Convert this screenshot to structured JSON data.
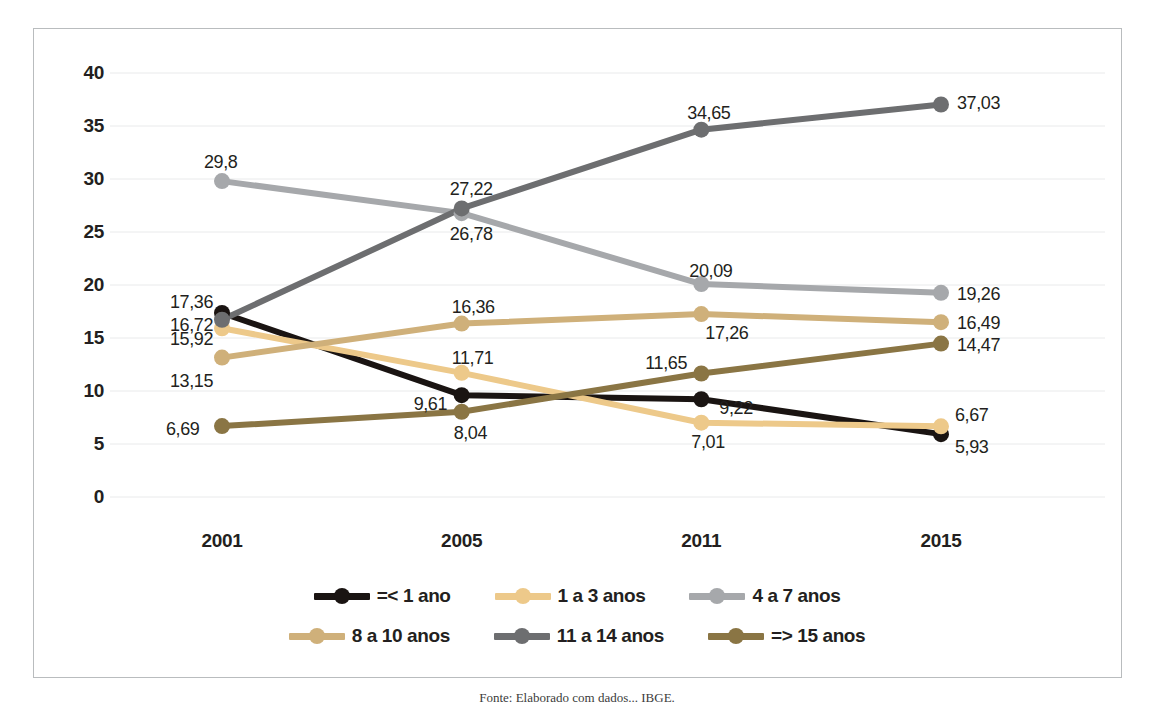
{
  "chart_data": {
    "type": "line",
    "title": "",
    "xlabel": "",
    "ylabel": "",
    "categories": [
      "2001",
      "2005",
      "2011",
      "2015"
    ],
    "ylim": [
      0,
      40
    ],
    "yticks": [
      0,
      5,
      10,
      15,
      20,
      25,
      30,
      35,
      40
    ],
    "ytick_labels": [
      "0",
      "5",
      "10",
      "15",
      "20",
      "25",
      "30",
      "35",
      "40"
    ],
    "grid": true,
    "legend_position": "bottom",
    "decimal_separator": ",",
    "series": [
      {
        "name": "=< 1 ano",
        "color": "#1a1412",
        "values": [
          17.36,
          9.61,
          9.22,
          5.93
        ],
        "labels": [
          "17,36",
          "9,61",
          "9,22",
          "5,93"
        ]
      },
      {
        "name": "1 a 3 anos",
        "color": "#edc98a",
        "values": [
          15.92,
          11.71,
          7.01,
          6.67
        ],
        "labels": [
          "15,92",
          "11,71",
          "7,01",
          "6,67"
        ]
      },
      {
        "name": "4 a 7 anos",
        "color": "#a6a8ab",
        "values": [
          29.8,
          26.78,
          20.09,
          19.26
        ],
        "labels": [
          "29,8",
          "26,78",
          "20,09",
          "19,26"
        ]
      },
      {
        "name": "8 a 10 anos",
        "color": "#cfb07a",
        "values": [
          13.15,
          16.36,
          17.26,
          16.49
        ],
        "labels": [
          "13,15",
          "16,36",
          "17,26",
          "16,49"
        ]
      },
      {
        "name": "11 a 14 anos",
        "color": "#6d6e70",
        "values": [
          16.72,
          27.22,
          34.65,
          37.03
        ],
        "labels": [
          "16,72",
          "27,22",
          "34,65",
          "37,03"
        ]
      },
      {
        "name": "=> 15 anos",
        "color": "#8a7544",
        "values": [
          6.69,
          8.04,
          11.65,
          14.47
        ],
        "labels": [
          "6,69",
          "8,04",
          "11,65",
          "14,47"
        ]
      }
    ]
  },
  "caption": "Fonte: Elaborado com dados... IBGE."
}
